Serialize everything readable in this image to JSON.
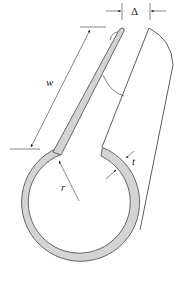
{
  "diagram": {
    "type": "engineering-schematic",
    "colors": {
      "background": "#ffffff",
      "material_fill": "#d4d4d4",
      "outline": "#333333"
    },
    "labels": {
      "delta": "Δ",
      "w": "w",
      "r": "r",
      "t": "t"
    },
    "dimensions": [
      {
        "symbol": "Δ",
        "meaning": "gap opening at top between flange tip and right surface"
      },
      {
        "symbol": "w",
        "meaning": "length of flange strip"
      },
      {
        "symbol": "r",
        "meaning": "ring radius"
      },
      {
        "symbol": "t",
        "meaning": "wall thickness"
      }
    ]
  }
}
